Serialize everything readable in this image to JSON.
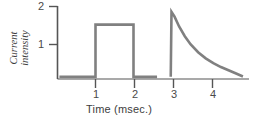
{
  "chart_data": {
    "type": "line",
    "title": "",
    "xlabel": "Time (msec.)",
    "ylabel": "Current intensity",
    "xlim": [
      0,
      4.9
    ],
    "ylim": [
      0,
      2.15
    ],
    "xticks": [
      1,
      2,
      3,
      4
    ],
    "xtick_labels": [
      "1",
      "2",
      "3",
      "4"
    ],
    "yticks": [
      1,
      2
    ],
    "ytick_labels": [
      "1",
      "2"
    ],
    "grid": false,
    "legend": "none",
    "trace_color": "#808080",
    "axis_color": "#555555",
    "series": [
      {
        "name": "square-pulse",
        "comment": "rectangular current pulse, onset 1 msec, offset 2 msec, amplitude 1.5",
        "points": [
          [
            0.05,
            0.06
          ],
          [
            1.0,
            0.06
          ],
          [
            1.0,
            1.5
          ],
          [
            2.0,
            1.5
          ],
          [
            2.0,
            0.06
          ],
          [
            2.62,
            0.06
          ]
        ]
      },
      {
        "name": "exponential-decay-pulse",
        "comment": "sharp onset at 3 msec rising to 1.85 then exponential decay to baseline",
        "points": [
          [
            2.98,
            0.06
          ],
          [
            3.0,
            1.85
          ],
          [
            3.08,
            1.72
          ],
          [
            3.2,
            1.45
          ],
          [
            3.35,
            1.18
          ],
          [
            3.5,
            0.96
          ],
          [
            3.7,
            0.74
          ],
          [
            3.9,
            0.57
          ],
          [
            4.1,
            0.44
          ],
          [
            4.3,
            0.33
          ],
          [
            4.5,
            0.24
          ],
          [
            4.7,
            0.15
          ],
          [
            4.88,
            0.07
          ]
        ]
      }
    ]
  },
  "labels": {
    "x_axis_title": "Time (msec.)",
    "y_axis_title_line1": "Current",
    "y_axis_title_line2": "intensity",
    "x_tick_1": "1",
    "x_tick_2": "2",
    "x_tick_3": "3",
    "x_tick_4": "4",
    "y_tick_1": "1",
    "y_tick_2": "2"
  },
  "colors": {
    "trace": "#808080",
    "axis": "#555555",
    "text": "#3d3d3d",
    "background": "#ffffff"
  }
}
